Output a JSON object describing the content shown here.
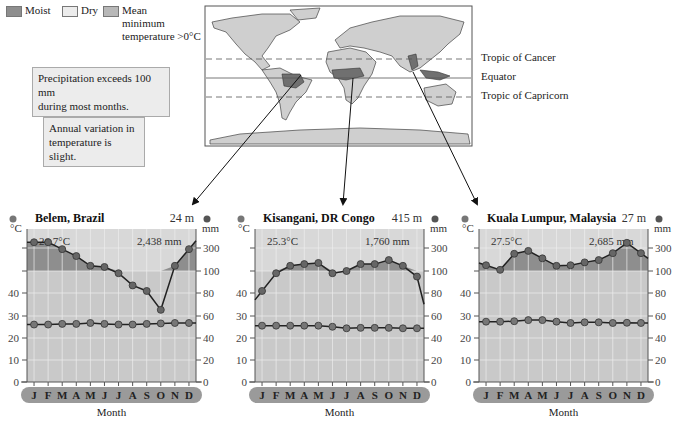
{
  "legend": {
    "items": [
      {
        "label": "Moist",
        "color": "#8e8e8e"
      },
      {
        "label": "Dry",
        "color": "#e6e6e6"
      },
      {
        "label": "Mean minimum temperature >0°C",
        "line1": "Mean",
        "line2": "minimum",
        "line3": "temperature >0°C",
        "color": "#b8b8b8"
      }
    ]
  },
  "notes": [
    {
      "line1": "Precipitation exceeds 100 mm",
      "line2": "during most months."
    },
    {
      "line1": "Annual variation in",
      "line2": "temperature is slight."
    }
  ],
  "map": {
    "lines": {
      "tropic_cancer": "Tropic of Cancer",
      "equator": "Equator",
      "tropic_capricorn": "Tropic of Capricorn"
    }
  },
  "axis": {
    "left_unit": "°C",
    "right_unit": "mm",
    "left_ticks": [
      "0",
      "10",
      "20",
      "30",
      "40"
    ],
    "right_ticks": [
      "0",
      "20",
      "40",
      "60",
      "80",
      "100",
      "300"
    ],
    "xlabel": "Month",
    "months": [
      "J",
      "F",
      "M",
      "A",
      "M",
      "J",
      "J",
      "A",
      "S",
      "O",
      "N",
      "D"
    ]
  },
  "chart_data": [
    {
      "type": "line",
      "title": "Belem, Brazil",
      "elevation": "24 m",
      "mean_temp_label": "26.7°C",
      "annual_precip_label": "2,438 mm",
      "categories": [
        "J",
        "F",
        "M",
        "A",
        "M",
        "J",
        "J",
        "A",
        "S",
        "O",
        "N",
        "D"
      ],
      "series": [
        {
          "name": "Temperature (°C)",
          "axis": "left",
          "values": [
            26,
            26,
            26.3,
            26.3,
            26.7,
            26.3,
            26,
            26,
            26.3,
            26.5,
            26.7,
            26.7
          ]
        },
        {
          "name": "Precipitation (mm)",
          "axis": "right",
          "values": [
            350,
            350,
            290,
            230,
            145,
            135,
            98,
            87,
            82,
            65,
            145,
            290
          ]
        }
      ],
      "xlabel": "Month",
      "ylabel_left": "°C",
      "ylabel_right": "mm",
      "ylim_left": [
        0,
        50
      ],
      "ylim_right": [
        0,
        400
      ]
    },
    {
      "type": "line",
      "title": "Kisangani, DR Congo",
      "elevation": "415 m",
      "mean_temp_label": "25.3°C",
      "annual_precip_label": "1,760 mm",
      "categories": [
        "J",
        "F",
        "M",
        "A",
        "M",
        "J",
        "J",
        "A",
        "S",
        "O",
        "N",
        "D"
      ],
      "series": [
        {
          "name": "Temperature (°C)",
          "axis": "left",
          "values": [
            25.5,
            25.5,
            25.5,
            25.5,
            25.5,
            25,
            24.3,
            24.5,
            24.5,
            24.5,
            24.3,
            24.3
          ]
        },
        {
          "name": "Precipitation (mm)",
          "axis": "right",
          "values": [
            82,
            98,
            145,
            160,
            170,
            98,
            100,
            160,
            160,
            195,
            145,
            95
          ]
        }
      ],
      "xlabel": "Month",
      "ylabel_left": "°C",
      "ylabel_right": "mm",
      "ylim_left": [
        0,
        50
      ],
      "ylim_right": [
        0,
        400
      ]
    },
    {
      "type": "line",
      "title": "Kuala Lumpur, Malaysia",
      "elevation": "27 m",
      "mean_temp_label": "27.5°C",
      "annual_precip_label": "2,685 mm",
      "categories": [
        "J",
        "F",
        "M",
        "A",
        "M",
        "J",
        "J",
        "A",
        "S",
        "O",
        "N",
        "D"
      ],
      "series": [
        {
          "name": "Temperature (°C)",
          "axis": "left",
          "values": [
            27.3,
            27.3,
            27.5,
            28,
            28,
            27.3,
            26.7,
            27,
            27,
            26.7,
            26.8,
            26.7
          ]
        },
        {
          "name": "Precipitation (mm)",
          "axis": "right",
          "values": [
            150,
            110,
            250,
            275,
            210,
            145,
            150,
            175,
            195,
            255,
            345,
            255
          ]
        }
      ],
      "xlabel": "Month",
      "ylabel_left": "°C",
      "ylabel_right": "mm",
      "ylim_left": [
        0,
        50
      ],
      "ylim_right": [
        0,
        400
      ]
    }
  ]
}
